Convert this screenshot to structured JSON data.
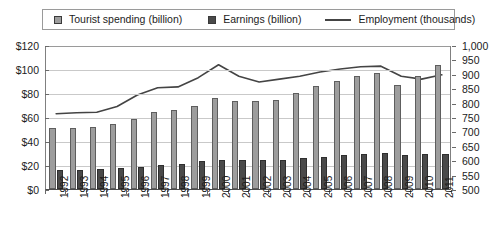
{
  "chart_data": {
    "type": "bar",
    "title": "",
    "subtitle": "",
    "xlabel": "",
    "ylabel": "",
    "grid": true,
    "legend_position": "top",
    "categories": [
      "1992",
      "1993",
      "1994",
      "1995",
      "1996",
      "1997",
      "1998",
      "1999",
      "2000",
      "2001",
      "2002",
      "2003",
      "2004",
      "2005",
      "2006",
      "2007",
      "2008",
      "2009",
      "2010",
      "2011"
    ],
    "axes": {
      "left": {
        "label": "",
        "ticks": [
          "$0",
          "$20",
          "$40",
          "$60",
          "$80",
          "$100",
          "$120"
        ],
        "tick_values": [
          0,
          20,
          40,
          60,
          80,
          100,
          120
        ],
        "min": 0,
        "max": 120,
        "step": 20,
        "unit": "billion US dollars",
        "prefix": "$"
      },
      "right": {
        "label": "",
        "ticks": [
          "500",
          "550",
          "600",
          "650",
          "700",
          "750",
          "800",
          "850",
          "900",
          "950",
          "1,000"
        ],
        "tick_values": [
          500,
          550,
          600,
          650,
          700,
          750,
          800,
          850,
          900,
          950,
          1000
        ],
        "min": 500,
        "max": 1000,
        "step": 50,
        "unit": "thousands of jobs"
      }
    },
    "series": [
      {
        "name": "Tourist spending (billion)",
        "type": "bar",
        "axis": "left",
        "color": "#9d9d9d",
        "border_color": "#5e5e5e",
        "values": [
          50.5,
          51,
          52,
          54,
          58.5,
          64.5,
          66,
          69.5,
          76,
          73,
          73,
          74.5,
          80,
          86,
          90,
          94,
          97,
          87,
          94,
          103
        ]
      },
      {
        "name": "Earnings (billion)",
        "type": "bar",
        "axis": "left",
        "color": "#4a4a4a",
        "border_color": "#2f2f2f",
        "values": [
          16,
          16,
          16.5,
          17.5,
          18.5,
          20,
          21,
          23,
          24.5,
          24,
          24,
          24.5,
          25.5,
          27,
          28,
          29.5,
          30,
          28.5,
          29,
          29.5
        ]
      },
      {
        "name": "Employment (thousands)",
        "type": "line",
        "axis": "right",
        "color": "#444444",
        "values": [
          765,
          768,
          770,
          790,
          830,
          855,
          858,
          890,
          935,
          895,
          875,
          885,
          895,
          910,
          920,
          928,
          930,
          895,
          885,
          900
        ]
      }
    ]
  }
}
